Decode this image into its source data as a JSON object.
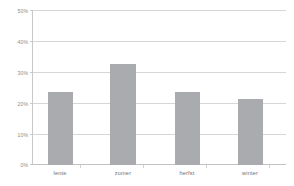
{
  "chart_data": {
    "type": "bar",
    "title": "",
    "subtitle": "",
    "xlabel": "",
    "ylabel": "",
    "categories": [
      "lente",
      "zomer",
      "herfst",
      "winter"
    ],
    "values": [
      23.5,
      32.5,
      23.7,
      21.3
    ],
    "series": [
      {
        "name": "",
        "values": [
          23.5,
          32.5,
          23.7,
          21.3
        ]
      }
    ],
    "ylim": [
      0,
      50
    ],
    "yticks": [
      0,
      10,
      20,
      30,
      40,
      50
    ],
    "ytick_labels": [
      "0%",
      "10%",
      "20%",
      "30%",
      "40%",
      "50%"
    ],
    "grid": true,
    "legend": false,
    "legend_position": "none",
    "annotations": [],
    "colors": {
      "bar": "#a9abae",
      "gridline": "#d6d6d6",
      "axis": "#c9c9c9",
      "tick_label": "#8d8d8d",
      "category_label": "#6f6f6f",
      "background": "#ffffff"
    }
  }
}
